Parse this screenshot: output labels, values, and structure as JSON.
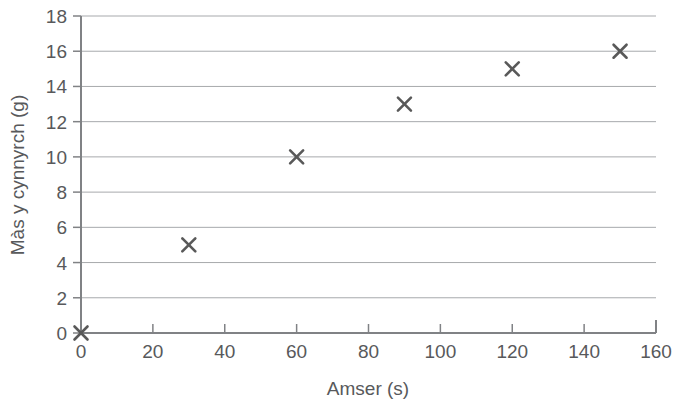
{
  "chart_data": {
    "type": "scatter",
    "title": "",
    "xlabel": "Amser (s)",
    "ylabel": "Màs y cynnyrch (g)",
    "x": [
      0,
      30,
      60,
      90,
      120,
      150
    ],
    "values": [
      0,
      5,
      10,
      13,
      15,
      16
    ],
    "series": [
      {
        "name": "",
        "points": [
          {
            "x": 0,
            "y": 0
          },
          {
            "x": 30,
            "y": 5
          },
          {
            "x": 60,
            "y": 10
          },
          {
            "x": 90,
            "y": 13
          },
          {
            "x": 120,
            "y": 15
          },
          {
            "x": 150,
            "y": 16
          }
        ]
      }
    ],
    "xlim": [
      0,
      160
    ],
    "ylim": [
      0,
      18
    ],
    "xticks": [
      0,
      20,
      40,
      60,
      80,
      100,
      120,
      140,
      160
    ],
    "yticks": [
      0,
      2,
      4,
      6,
      8,
      10,
      12,
      14,
      16,
      18
    ],
    "xtick_labels": [
      "0",
      "20",
      "40",
      "60",
      "80",
      "100",
      "120",
      "140",
      "160"
    ],
    "ytick_labels": [
      "0",
      "2",
      "4",
      "6",
      "8",
      "10",
      "12",
      "14",
      "16",
      "18"
    ],
    "grid": "horizontal",
    "legend": "none",
    "marker": "x",
    "colors": {
      "axis": "#808285",
      "grid": "#a7a9ac",
      "marker": "#595959",
      "text": "#58595b",
      "background": "#ffffff"
    }
  }
}
